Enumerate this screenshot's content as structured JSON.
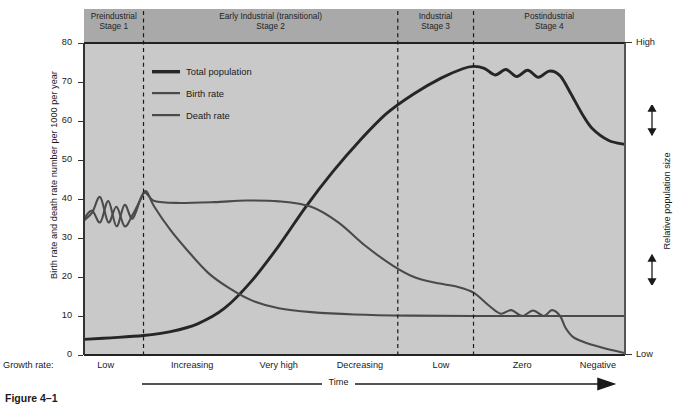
{
  "figure": {
    "caption": "Figure 4–1"
  },
  "chart_data": {
    "type": "line",
    "ylabel": "Birth rate and death rate number per 1000 per year",
    "xlabel": "Time",
    "ylim": [
      0,
      80
    ],
    "yticks": [
      0,
      10,
      20,
      30,
      40,
      50,
      60,
      70,
      80
    ],
    "grid": false,
    "legend_position": "upper-left-inside",
    "right_axis": {
      "label": "Relative population size",
      "top_label": "High",
      "bottom_label": "Low"
    },
    "stages": [
      {
        "name": "Preindustrial",
        "stage": "Stage 1",
        "x_start": 0,
        "x_end": 11
      },
      {
        "name": "Early Industrial (transitional)",
        "stage": "Stage 2",
        "x_start": 11,
        "x_end": 58
      },
      {
        "name": "Industrial",
        "stage": "Stage 3",
        "x_start": 58,
        "x_end": 72
      },
      {
        "name": "Postindustrial",
        "stage": "Stage 4",
        "x_start": 72,
        "x_end": 100
      }
    ],
    "growth_rate_row_label": "Growth rate:",
    "growth_rate_labels": [
      {
        "label": "Low",
        "x": 4
      },
      {
        "label": "Increasing",
        "x": 20
      },
      {
        "label": "Very high",
        "x": 36
      },
      {
        "label": "Decreasing",
        "x": 51
      },
      {
        "label": "Low",
        "x": 66
      },
      {
        "label": "Zero",
        "x": 81
      },
      {
        "label": "Negative",
        "x": 95
      }
    ],
    "series": [
      {
        "name": "Total population",
        "color": "#262626",
        "width": 2.9,
        "points": [
          [
            0,
            4
          ],
          [
            5,
            4.4
          ],
          [
            11,
            5
          ],
          [
            16,
            6
          ],
          [
            21,
            8
          ],
          [
            26,
            12
          ],
          [
            31,
            19
          ],
          [
            36,
            28
          ],
          [
            41,
            38
          ],
          [
            46,
            47
          ],
          [
            51,
            55
          ],
          [
            56,
            62
          ],
          [
            61,
            67
          ],
          [
            66,
            71
          ],
          [
            70,
            73.4
          ],
          [
            72,
            74
          ],
          [
            74,
            73.5
          ],
          [
            76,
            71.8
          ],
          [
            78,
            73.2
          ],
          [
            80,
            71.4
          ],
          [
            82,
            73
          ],
          [
            84,
            71.2
          ],
          [
            86,
            72.8
          ],
          [
            88,
            71.6
          ],
          [
            90,
            67
          ],
          [
            92,
            62
          ],
          [
            94,
            58
          ],
          [
            97,
            55
          ],
          [
            100,
            54
          ]
        ]
      },
      {
        "name": "Birth rate",
        "color": "#4a4a4a",
        "width": 2.1,
        "points": [
          [
            0,
            35
          ],
          [
            1.5,
            37
          ],
          [
            3,
            34
          ],
          [
            4.5,
            39.5
          ],
          [
            6,
            33
          ],
          [
            7.5,
            38.5
          ],
          [
            9,
            35
          ],
          [
            11,
            41.5
          ],
          [
            13,
            39.5
          ],
          [
            17,
            39
          ],
          [
            24,
            39.2
          ],
          [
            30,
            39.6
          ],
          [
            36,
            39.4
          ],
          [
            42,
            38
          ],
          [
            47,
            34
          ],
          [
            52,
            28
          ],
          [
            57,
            23
          ],
          [
            61,
            20
          ],
          [
            65,
            18.5
          ],
          [
            69,
            17.5
          ],
          [
            72,
            16
          ],
          [
            75,
            12.5
          ],
          [
            77,
            10.6
          ],
          [
            79,
            11.5
          ],
          [
            81,
            10
          ],
          [
            83,
            11.4
          ],
          [
            85,
            10
          ],
          [
            86.5,
            11.5
          ],
          [
            88,
            10
          ],
          [
            89,
            7
          ],
          [
            90.5,
            4.5
          ],
          [
            93,
            3
          ],
          [
            96,
            1.8
          ],
          [
            100,
            0.5
          ]
        ]
      },
      {
        "name": "Death rate",
        "color": "#4a4a4a",
        "width": 2.1,
        "points": [
          [
            0,
            34.5
          ],
          [
            1.5,
            36.5
          ],
          [
            3,
            40.5
          ],
          [
            4.5,
            34
          ],
          [
            6,
            38
          ],
          [
            7.5,
            33
          ],
          [
            9,
            36
          ],
          [
            10.5,
            40
          ],
          [
            11.5,
            42
          ],
          [
            13,
            38
          ],
          [
            16,
            32
          ],
          [
            19,
            27
          ],
          [
            23,
            21
          ],
          [
            27,
            17
          ],
          [
            31,
            14
          ],
          [
            36,
            12
          ],
          [
            42,
            11
          ],
          [
            50,
            10.4
          ],
          [
            60,
            10.1
          ],
          [
            72,
            10
          ],
          [
            85,
            10
          ],
          [
            100,
            10
          ]
        ]
      }
    ]
  },
  "legend": {
    "items": [
      {
        "label": "Total population",
        "color": "#262626",
        "width": 3.4
      },
      {
        "label": "Birth rate",
        "color": "#4a4a4a",
        "width": 2.2
      },
      {
        "label": "Death rate",
        "color": "#4a4a4a",
        "width": 2.2
      }
    ]
  }
}
